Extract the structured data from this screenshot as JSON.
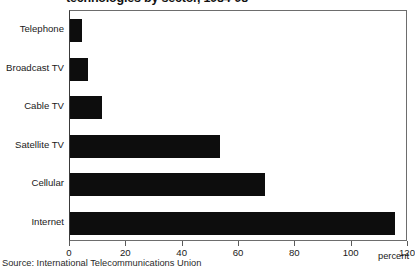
{
  "chart_data": {
    "type": "bar",
    "orientation": "horizontal",
    "title": "technologies by sector, 1984-98",
    "categories": [
      "Telephone",
      "Broadcast TV",
      "Cable TV",
      "Satellite TV",
      "Cellular",
      "Internet"
    ],
    "values": [
      4,
      6,
      11,
      53,
      69,
      115
    ],
    "series": [
      {
        "name": "percent",
        "values": [
          4,
          6,
          11,
          53,
          69,
          115
        ]
      }
    ],
    "xlabel": "percent",
    "ylabel": "",
    "xlim": [
      0,
      120
    ],
    "xticks": [
      0,
      20,
      40,
      60,
      80,
      100,
      120
    ],
    "xtick_labels": [
      "0",
      "20",
      "40",
      "60",
      "80",
      "100",
      "120"
    ],
    "grid": false,
    "legend": false,
    "bar_color": "#0d0d0d",
    "source": "Source: International Telecommunications Union"
  }
}
